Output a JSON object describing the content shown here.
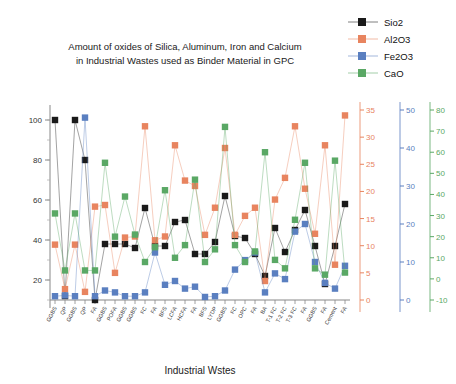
{
  "chart_data": {
    "type": "line",
    "title_line1": "Amount of oxides of Silica, Aluminum, Iron and Calcium",
    "title_line2": "in Industrial Wastes used as Binder Material in GPC",
    "xlabel": "Industrial Wstes",
    "ylabel": "",
    "grid": false,
    "legend_position": "top-right",
    "categories": [
      "GGBS",
      "QP",
      "GGBS",
      "QP",
      "FA",
      "GGBS",
      "POFA",
      "GGBS",
      "GGBS",
      "FC",
      "FA",
      "BFS",
      "LCFA",
      "HCFA",
      "FA",
      "BFS",
      "LYDP",
      "GGBS",
      "FC",
      "OPC",
      "FA",
      "BA",
      "T-1 FC",
      "T-2 FC",
      "T-3 FC",
      "FA",
      "GGBS",
      "FA",
      "Cement",
      "FA"
    ],
    "axes": [
      {
        "name": "Sio2",
        "color": "#1a1a1a",
        "min": 10,
        "max": 105,
        "ticks": [
          20,
          40,
          60,
          80,
          100
        ],
        "side": "left"
      },
      {
        "name": "Al2O3",
        "color": "#e8845f",
        "min": 0,
        "max": 35,
        "ticks": [
          0,
          5,
          10,
          15,
          20,
          25,
          30,
          35
        ],
        "side": "right"
      },
      {
        "name": "Fe2O3",
        "color": "#5a7fc0",
        "min": 0,
        "max": 50,
        "ticks": [
          0,
          10,
          20,
          30,
          40,
          50
        ],
        "side": "right"
      },
      {
        "name": "CaO",
        "color": "#5aa865",
        "min": -10,
        "max": 80,
        "ticks": [
          -10,
          0,
          10,
          20,
          30,
          40,
          50,
          60,
          70,
          80
        ],
        "side": "right"
      }
    ],
    "series": [
      {
        "name": "Sio2",
        "color": "#1a1a1a",
        "axis": 0,
        "values": [
          100,
          12,
          100,
          80,
          10,
          38,
          38,
          38,
          36,
          56,
          37,
          37,
          49,
          50,
          33,
          33,
          39,
          62,
          42,
          41,
          33,
          22,
          46,
          34,
          45,
          55,
          37,
          18,
          37,
          58
        ]
      },
      {
        "name": "Al2O3",
        "color": "#e8845f",
        "axis": 1,
        "values": [
          10.2,
          2.0,
          10.2,
          1.5,
          17.2,
          17.5,
          5.0,
          11.5,
          11.7,
          32.0,
          11.0,
          11.7,
          28.5,
          22.0,
          21.0,
          12.0,
          17.0,
          28.0,
          12.0,
          15.5,
          17.0,
          3.5,
          18.5,
          22.5,
          32.0,
          20.5,
          12.2,
          28.5,
          6.5,
          34.0
        ]
      },
      {
        "name": "Fe2O3",
        "color": "#5a7fc0",
        "axis": 2,
        "values": [
          1.0,
          1.2,
          1.0,
          48.0,
          1.0,
          2.5,
          2.0,
          1.0,
          1.0,
          2.0,
          12.5,
          4.0,
          5.0,
          3.0,
          3.5,
          0.8,
          1.0,
          2.5,
          8.0,
          10.5,
          12.5,
          2.0,
          7.0,
          5.5,
          18.0,
          20.0,
          10.0,
          4.5,
          3.0,
          9.0
        ]
      },
      {
        "name": "CaO",
        "color": "#5aa865",
        "axis": 3,
        "values": [
          31,
          4,
          31,
          4,
          4,
          55,
          20,
          39,
          21,
          8,
          15,
          42,
          10,
          16,
          47,
          8,
          14,
          72,
          16,
          8,
          13,
          60,
          9,
          5,
          28,
          55,
          5,
          2,
          56,
          3
        ]
      }
    ],
    "legend": [
      {
        "label": "Sio2",
        "color": "#1a1a1a"
      },
      {
        "label": "Al2O3",
        "color": "#e8845f"
      },
      {
        "label": "Fe2O3",
        "color": "#5a7fc0"
      },
      {
        "label": "CaO",
        "color": "#5aa865"
      }
    ]
  }
}
